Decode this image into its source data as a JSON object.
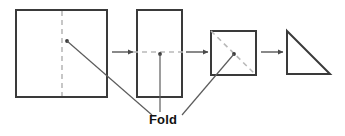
{
  "diagram": {
    "label": {
      "text": "Fold",
      "x": 163,
      "y": 124
    },
    "colors": {
      "background": "#ffffff",
      "shape_outline": "#3a3a3a",
      "fold_dash": "#b9b9b9",
      "arrow": "#4a4a4a",
      "leader": "#5c5c5c",
      "label_text": "#111111"
    },
    "steps": [
      {
        "name": "step-1-square",
        "shape": "square",
        "points": "16,10 107,10 107,97 16,97",
        "fold_line": {
          "type": "vertical",
          "d": "M 62,11 L 62,96"
        },
        "leader_dot": {
          "x": 67,
          "y": 41
        }
      },
      {
        "name": "step-2-rectangle",
        "shape": "rectangle",
        "points": "137,10 182,10 182,97 137,97",
        "fold_line": {
          "type": "horizontal",
          "d": "M 133,52 L 187,52"
        },
        "leader_dot": {
          "x": 160,
          "y": 54
        }
      },
      {
        "name": "step-3-square",
        "shape": "square",
        "points": "211,31 256,31 256,75 211,75",
        "fold_line": {
          "type": "diagonal",
          "d": "M 211,31 L 256,75"
        },
        "leader_dot": {
          "x": 234,
          "y": 54
        }
      },
      {
        "name": "step-4-triangle",
        "shape": "triangle",
        "points": "287,31 330,74 287,74",
        "fold_line": null,
        "leader_dot": null
      }
    ],
    "arrows": [
      {
        "name": "arrow-1-to-2",
        "x1": 112,
        "y1": 52,
        "x2": 133,
        "y2": 52
      },
      {
        "name": "arrow-2-to-3",
        "x1": 186,
        "y1": 52,
        "x2": 208,
        "y2": 52
      },
      {
        "name": "arrow-3-to-4",
        "x1": 261,
        "y1": 52,
        "x2": 283,
        "y2": 52
      }
    ],
    "leaders": [
      {
        "name": "leader-from-step-1",
        "d": "M 67,41 L 152,115"
      },
      {
        "name": "leader-from-step-2",
        "d": "M 160,54 L 160,112"
      },
      {
        "name": "leader-from-step-3",
        "d": "M 234,54 L 182,115"
      }
    ]
  }
}
